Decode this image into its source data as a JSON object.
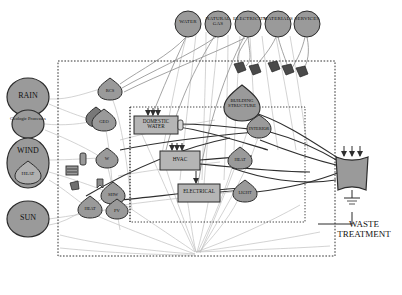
{
  "diagram": {
    "colors": {
      "node_fill": "#9a9a9a",
      "node_stroke": "#2b2b2b",
      "box_fill": "#b5b5b5",
      "marker_fill": "#4a4a4a",
      "flow_light": "#b9b9b9",
      "flow_dark": "#2f2f2f",
      "boundary": "#333333"
    },
    "inputs_top": [
      {
        "id": "water",
        "label": "WATER",
        "cx": 188,
        "cy": 24,
        "r": 13
      },
      {
        "id": "natural-gas",
        "label": "NATURAL GAS",
        "cx": 218,
        "cy": 24,
        "r": 13
      },
      {
        "id": "electricity",
        "label": "ELECTRICITY",
        "cx": 248,
        "cy": 24,
        "r": 13
      },
      {
        "id": "materials",
        "label": "MATERIALS",
        "cx": 278,
        "cy": 24,
        "r": 13
      },
      {
        "id": "services",
        "label": "SERVICES",
        "cx": 307,
        "cy": 24,
        "r": 13
      }
    ],
    "inputs_left": [
      {
        "id": "rain",
        "label": "RAIN",
        "cx": 28,
        "cy": 97,
        "rx": 21,
        "ry": 19
      },
      {
        "id": "geologic-processes",
        "label": "Geologic Processes",
        "cx": 28,
        "cy": 124,
        "rx": 16,
        "ry": 14
      },
      {
        "id": "wind",
        "label": "WIND",
        "cx": 28,
        "cy": 163,
        "rx": 21,
        "ry": 25
      },
      {
        "id": "heat-wind",
        "label": "HEAT",
        "cx": 28,
        "cy": 172,
        "rx": 13,
        "ry": 10
      },
      {
        "id": "sun",
        "label": "SUN",
        "cx": 28,
        "cy": 219,
        "rx": 21,
        "ry": 18
      }
    ],
    "systems": [
      {
        "id": "rcs",
        "label": "RCS",
        "cx": 110,
        "cy": 89,
        "r": 11
      },
      {
        "id": "geo",
        "label": "GEO",
        "cx": 104,
        "cy": 120,
        "r": 11
      },
      {
        "id": "geo-shadow",
        "label": "",
        "cx": 96,
        "cy": 117,
        "r": 9
      },
      {
        "id": "w",
        "label": "W",
        "cx": 107,
        "cy": 158,
        "r": 10
      },
      {
        "id": "shw",
        "label": "SHW",
        "cx": 113,
        "cy": 193,
        "r": 11
      },
      {
        "id": "heat-small",
        "label": "HEAT",
        "cx": 90,
        "cy": 207,
        "r": 11
      },
      {
        "id": "pv",
        "label": "PV",
        "cx": 117,
        "cy": 209,
        "r": 10
      }
    ],
    "building_nodes": [
      {
        "id": "building-structure",
        "label": "BUILDING STRUCTURE",
        "cx": 242,
        "cy": 103,
        "r": 18
      },
      {
        "id": "interior",
        "label": "INTERIOR",
        "cx": 259,
        "cy": 127,
        "r": 12
      },
      {
        "id": "heat-zone",
        "label": "HEAT",
        "cx": 240,
        "cy": 158,
        "r": 11
      },
      {
        "id": "light-zone",
        "label": "LIGHT",
        "cx": 245,
        "cy": 191,
        "r": 11
      }
    ],
    "boxes": [
      {
        "id": "domestic-water",
        "label": "DOMESTIC WATER",
        "x": 134,
        "y": 116,
        "w": 44,
        "h": 18
      },
      {
        "id": "hvac",
        "label": "HVAC",
        "x": 160,
        "y": 151,
        "w": 40,
        "h": 19
      },
      {
        "id": "electrical",
        "label": "ELECTRICAL",
        "x": 178,
        "y": 184,
        "w": 42,
        "h": 18
      }
    ],
    "output": {
      "id": "waste-treatment",
      "label": "WASTE TREATMENT",
      "symbol_x": 352,
      "symbol_y": 168,
      "label_x": 363,
      "label_y": 228
    },
    "boundaries": [
      {
        "id": "site-boundary",
        "x": 58,
        "y": 61,
        "w": 277,
        "h": 195
      },
      {
        "id": "building-boundary",
        "x": 130,
        "y": 107,
        "w": 175,
        "h": 115
      }
    ],
    "markers_top": [
      {
        "id": "marker-1",
        "x": 238,
        "y": 68
      },
      {
        "id": "marker-2",
        "x": 253,
        "y": 70
      },
      {
        "id": "marker-3",
        "x": 272,
        "y": 67
      },
      {
        "id": "marker-4",
        "x": 286,
        "y": 70
      },
      {
        "id": "marker-5",
        "x": 300,
        "y": 72
      }
    ],
    "misc_icons": [
      {
        "id": "icon-tag-1",
        "x": 80,
        "y": 153,
        "w": 6,
        "h": 12
      },
      {
        "id": "icon-bars",
        "x": 66,
        "y": 166,
        "w": 12,
        "h": 9
      },
      {
        "id": "icon-arrow-1",
        "x": 70,
        "y": 182,
        "w": 9,
        "h": 9
      },
      {
        "id": "icon-arrow-2",
        "x": 97,
        "y": 178,
        "w": 7,
        "h": 10
      }
    ]
  }
}
